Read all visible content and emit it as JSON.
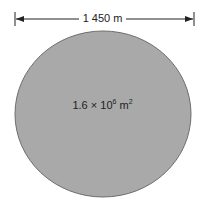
{
  "diagram": {
    "diameter_label": "1 450 m",
    "area_label": {
      "coefficient": "1.6 × 10",
      "exponent": "6",
      "unit": " m",
      "unit_exponent": "2"
    },
    "colors": {
      "fill": "#a9a9a9",
      "stroke": "#6e6e6e",
      "line": "#222222"
    }
  }
}
